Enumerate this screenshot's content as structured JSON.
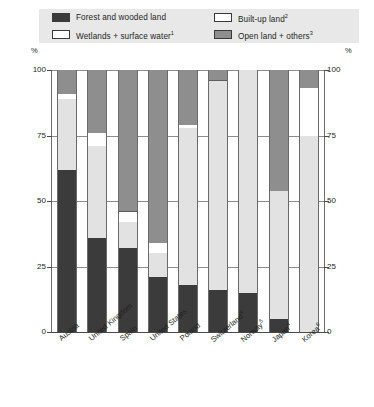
{
  "legend": {
    "items": [
      {
        "label": "Forest and wooded land",
        "sup": "",
        "color": "#3b3b3b",
        "key": "forest"
      },
      {
        "label": "Wetlands + surface water",
        "sup": "1",
        "color": "#ffffff",
        "key": "wetlands"
      },
      {
        "label": "Built-up land",
        "sup": "2",
        "color": "#ffffff",
        "key": "builtup"
      },
      {
        "label": "Open land + others",
        "sup": "3",
        "color": "#8e8e8e",
        "key": "open"
      }
    ]
  },
  "axis": {
    "unit_left": "%",
    "unit_right": "%",
    "ticks": [
      "100",
      "75",
      "50",
      "25",
      "0"
    ]
  },
  "chart_data": {
    "type": "bar",
    "title": "",
    "xlabel": "",
    "ylabel": "%",
    "ylim": [
      0,
      100
    ],
    "yticks": [
      0,
      25,
      50,
      75,
      100
    ],
    "grid": true,
    "stacked": true,
    "legend_position": "top",
    "categories": [
      "Austria",
      "United Kingdom",
      "Spain",
      "United States",
      "Poland",
      "Switzerland",
      "Norway",
      "Japan",
      "Korea"
    ],
    "category_labels": [
      "Austria",
      "United Kingdom",
      "Spain",
      "United States",
      "Poland",
      "Switzerland4",
      "Norway5",
      "Japan4",
      "Korea6"
    ],
    "category_sups": [
      "",
      "",
      "",
      "",
      "",
      "4",
      "5",
      "4",
      "6"
    ],
    "series": [
      {
        "name": "Forest and wooded land",
        "color": "#3b3b3b",
        "values": [
          62,
          36,
          32,
          21,
          18,
          16,
          15,
          5,
          0
        ]
      },
      {
        "name": "Built-up land",
        "color": "#e2e2e2",
        "values": [
          27,
          35,
          10,
          9,
          60,
          80,
          85,
          49,
          75
        ]
      },
      {
        "name": "Wetlands + surface water",
        "color": "#ffffff",
        "values": [
          2,
          5,
          4,
          4,
          1,
          0,
          0,
          0,
          18
        ]
      },
      {
        "name": "Open land + others",
        "color": "#8e8e8e",
        "values": [
          9,
          24,
          54,
          66,
          21,
          4,
          0,
          46,
          7
        ]
      }
    ]
  }
}
